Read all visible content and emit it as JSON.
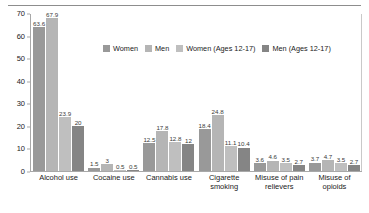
{
  "chart_data": {
    "type": "bar",
    "title": "",
    "subtitle": "",
    "xlabel": "",
    "ylabel": "",
    "ylim": [
      0,
      70
    ],
    "yticks": [
      0,
      10,
      20,
      30,
      40,
      50,
      60,
      70
    ],
    "grid": false,
    "legend_position": "upper-center",
    "categories": [
      "Alcohol use",
      "Cocaine use",
      "Cannabis use",
      "Cigarette\nsmoking",
      "Misuse of pain\nrelievers",
      "Misuse of\nopioids"
    ],
    "series": [
      {
        "name": "Women",
        "color": "#999999",
        "values": [
          63.6,
          1.5,
          12.5,
          18.4,
          3.6,
          3.7
        ],
        "labels": [
          "63.6",
          "1.5",
          "12.5",
          "18.4",
          "3.6",
          "3.7"
        ]
      },
      {
        "name": "Men",
        "color": "#b5b5b5",
        "values": [
          67.9,
          3,
          17.8,
          24.8,
          4.6,
          4.7
        ],
        "labels": [
          "67.9",
          "3",
          "17.8",
          "24.8",
          "4.6",
          "4.7"
        ]
      },
      {
        "name": "Women (Ages 12-17)",
        "color": "#bfbfbf",
        "values": [
          23.9,
          0.5,
          12.8,
          11.1,
          3.5,
          3.5
        ],
        "labels": [
          "23.9",
          "0.5",
          "12.8",
          "11.1",
          "3.5",
          "3.5"
        ]
      },
      {
        "name": "Men (Ages 12-17)",
        "color": "#858585",
        "values": [
          20,
          0.5,
          12,
          10.4,
          2.7,
          2.7
        ],
        "labels": [
          "20",
          "0.5",
          "12",
          "10.4",
          "2.7",
          "2.7"
        ]
      }
    ]
  },
  "figure": {
    "top_rule_color": "#8d8d8d",
    "axis_color": "#a8a8a8",
    "background": "#ffffff"
  }
}
